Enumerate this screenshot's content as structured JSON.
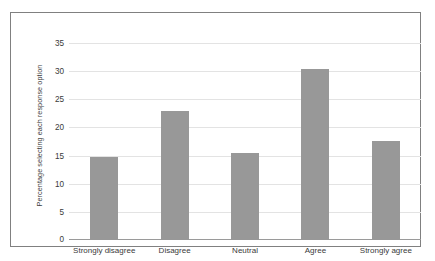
{
  "chart_data": {
    "type": "bar",
    "title": "",
    "subtitle": "",
    "xlabel": "",
    "ylabel": "Percentage selecting each response option",
    "categories": [
      "Strongly disagree",
      "Disagree",
      "Neutral",
      "Agree",
      "Strongly agree"
    ],
    "values": [
      14.7,
      22.9,
      15.5,
      30.3,
      17.6
    ],
    "series": [
      {
        "name": "Percentage selecting each response option",
        "values": [
          14.7,
          22.9,
          15.5,
          30.3,
          17.6
        ]
      }
    ],
    "ylim": [
      0,
      35
    ],
    "yticks": [
      0,
      5,
      10,
      15,
      20,
      25,
      30,
      35
    ],
    "ytick_labels": [
      "0",
      "5",
      "10",
      "15",
      "20",
      "25",
      "30",
      "35"
    ],
    "grid": "horizontal",
    "legend": "none",
    "bar_color": "#989898",
    "grid_color": "#e3e3e3",
    "axis_color": "#9a9a9a",
    "frame_color": "#808080",
    "background": "#ffffff",
    "annotations": []
  }
}
